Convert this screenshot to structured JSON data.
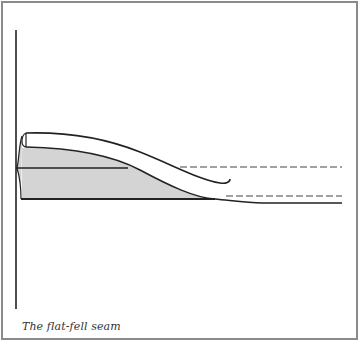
{
  "figure": {
    "caption": "The flat-fell seam",
    "colors": {
      "line": "#222222",
      "fill": "#d4d4d4",
      "frame": "#8a8a8a",
      "background": "#ffffff"
    },
    "elements": [
      "vertical-edge-line",
      "folded-top-fabric-layer",
      "shaded-seam-allowance",
      "middle-seam-line",
      "upper-dashed-stitch-line",
      "lower-dashed-stitch-line",
      "bottom-fabric-line"
    ]
  }
}
